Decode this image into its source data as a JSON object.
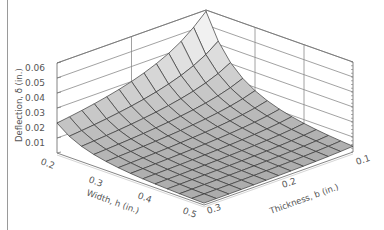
{
  "chart_data": {
    "type": "surface3d",
    "title": "",
    "xlabel": "Width, h (in.)",
    "ylabel": "Thickness, b (in.)",
    "zlabel": "Deflection, δ (in.)",
    "x_ticks": [
      "0.2",
      "0.3",
      "0.4",
      "0.5"
    ],
    "y_ticks": [
      "0.1",
      "0.2",
      "0.3"
    ],
    "z_ticks": [
      "0.01",
      "0.02",
      "0.03",
      "0.04",
      "0.05",
      "0.06"
    ],
    "xlim": [
      0.2,
      0.5
    ],
    "ylim": [
      0.1,
      0.3
    ],
    "zlim": [
      0,
      0.06
    ],
    "grid": true,
    "mesh": {
      "width_steps": 12,
      "thickness_steps": 12
    },
    "surface_model": "delta = 0.000048 / (b * h^3), clipped at 0.06",
    "sample_values": [
      {
        "h": 0.2,
        "b": 0.3,
        "delta": 0.02
      },
      {
        "h": 0.2,
        "b": 0.1,
        "delta": 0.06
      },
      {
        "h": 0.5,
        "b": 0.3,
        "delta": 0.0013
      },
      {
        "h": 0.5,
        "b": 0.1,
        "delta": 0.0038
      }
    ],
    "colors": {
      "surface_light": "#f2f2f2",
      "surface_dark": "#a9a9a9",
      "mesh": "#3a3a3a",
      "box": "#777777"
    }
  }
}
